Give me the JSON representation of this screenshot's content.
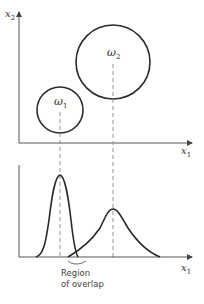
{
  "diagram": {
    "top_plot": {
      "y_axis_label": "x",
      "y_axis_sub": "2",
      "x_axis_label": "x",
      "x_axis_sub": "1",
      "classes": [
        {
          "name": "ω",
          "sub": "1",
          "cx": 60,
          "cy": 110,
          "r": 23
        },
        {
          "name": "ω",
          "sub": "2",
          "cx": 113,
          "cy": 62,
          "r": 37
        }
      ]
    },
    "bottom_plot": {
      "x_axis_label": "x",
      "x_axis_sub": "1",
      "annotation_line1": "Region",
      "annotation_line2": "of overlap"
    },
    "colors": {
      "ink": "#2a2a2a",
      "axis": "#555555",
      "dash": "#888888"
    }
  }
}
